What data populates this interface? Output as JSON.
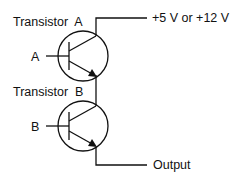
{
  "transistor_a": {
    "label": "Transistor  A",
    "input_label": "A"
  },
  "transistor_b": {
    "label": "Transistor  B",
    "input_label": "B"
  },
  "supply_label": "+5 V or +12 V",
  "output_label": "Output",
  "colors": {
    "line": "#111111",
    "background": "#ffffff"
  }
}
